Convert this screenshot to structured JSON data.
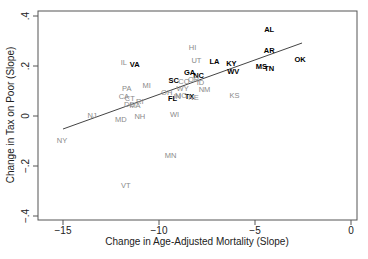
{
  "chart_data": {
    "type": "scatter",
    "title": "",
    "xlabel": "Change in Age-Adjusted Mortality (Slope)",
    "ylabel": "Change in Tax on Poor (Slope)",
    "xlim": [
      -16.3,
      0.3
    ],
    "ylim": [
      -0.42,
      0.42
    ],
    "xticks": [
      -15,
      -10,
      -5,
      0
    ],
    "xtick_labels": [
      "−15",
      "−10",
      "−5",
      "0"
    ],
    "yticks": [
      -0.4,
      -0.2,
      0,
      0.2,
      0.4
    ],
    "ytick_labels": [
      "−.4",
      "−.2",
      "0",
      ".2",
      ".4"
    ],
    "grid": false,
    "legend": null,
    "fit_line": {
      "x": [
        -15,
        -2.55
      ],
      "y": [
        -0.052,
        0.292
      ]
    },
    "colors": {
      "south": "#000000",
      "other": "#8a8a8a",
      "line": "#444444",
      "frame": "#555555"
    },
    "points": [
      {
        "label": "AL",
        "x": -4.26,
        "y": 0.348,
        "group": "south"
      },
      {
        "label": "AR",
        "x": -4.26,
        "y": 0.264,
        "group": "south"
      },
      {
        "label": "OK",
        "x": -2.65,
        "y": 0.228,
        "group": "south"
      },
      {
        "label": "MS",
        "x": -4.67,
        "y": 0.2,
        "group": "south"
      },
      {
        "label": "TN",
        "x": -4.26,
        "y": 0.192,
        "group": "south"
      },
      {
        "label": "KY",
        "x": -6.23,
        "y": 0.212,
        "group": "south"
      },
      {
        "label": "WV",
        "x": -6.13,
        "y": 0.18,
        "group": "south"
      },
      {
        "label": "LA",
        "x": -7.11,
        "y": 0.22,
        "group": "south"
      },
      {
        "label": "GA",
        "x": -8.41,
        "y": 0.176,
        "group": "south"
      },
      {
        "label": "NC",
        "x": -7.94,
        "y": 0.164,
        "group": "south"
      },
      {
        "label": "SC",
        "x": -9.24,
        "y": 0.144,
        "group": "south"
      },
      {
        "label": "TX",
        "x": -8.41,
        "y": 0.08,
        "group": "south"
      },
      {
        "label": "FL",
        "x": -9.29,
        "y": 0.072,
        "group": "south"
      },
      {
        "label": "VA",
        "x": -11.26,
        "y": 0.208,
        "group": "south"
      },
      {
        "label": "UT",
        "x": -8.05,
        "y": 0.224,
        "group": "other"
      },
      {
        "label": "HI",
        "x": -8.25,
        "y": 0.276,
        "group": "other"
      },
      {
        "label": "ID",
        "x": -7.84,
        "y": 0.136,
        "group": "other"
      },
      {
        "label": "NM",
        "x": -7.63,
        "y": 0.108,
        "group": "other"
      },
      {
        "label": "WY",
        "x": -8.77,
        "y": 0.112,
        "group": "other"
      },
      {
        "label": "CO",
        "x": -8.7,
        "y": 0.14,
        "group": "other"
      },
      {
        "label": "OR",
        "x": -8.2,
        "y": 0.15,
        "group": "other"
      },
      {
        "label": "OH",
        "x": -9.6,
        "y": 0.096,
        "group": "other"
      },
      {
        "label": "IN",
        "x": -9.05,
        "y": 0.08,
        "group": "other"
      },
      {
        "label": "MO",
        "x": -8.85,
        "y": 0.086,
        "group": "other"
      },
      {
        "label": "NE",
        "x": -8.2,
        "y": 0.078,
        "group": "other"
      },
      {
        "label": "KS",
        "x": -6.07,
        "y": 0.084,
        "group": "other"
      },
      {
        "label": "WI",
        "x": -9.19,
        "y": 0.008,
        "group": "other"
      },
      {
        "label": "MN",
        "x": -9.4,
        "y": -0.156,
        "group": "other"
      },
      {
        "label": "VT",
        "x": -11.73,
        "y": -0.276,
        "group": "other"
      },
      {
        "label": "NY",
        "x": -15.05,
        "y": -0.096,
        "group": "other"
      },
      {
        "label": "NJ",
        "x": -13.49,
        "y": 0.004,
        "group": "other"
      },
      {
        "label": "MD",
        "x": -11.99,
        "y": -0.012,
        "group": "other"
      },
      {
        "label": "NH",
        "x": -11.0,
        "y": 0.0,
        "group": "other"
      },
      {
        "label": "MI",
        "x": -10.64,
        "y": 0.124,
        "group": "other"
      },
      {
        "label": "PA",
        "x": -11.68,
        "y": 0.112,
        "group": "other"
      },
      {
        "label": "CA",
        "x": -11.83,
        "y": 0.08,
        "group": "other"
      },
      {
        "label": "CT",
        "x": -11.52,
        "y": 0.072,
        "group": "other"
      },
      {
        "label": "RI",
        "x": -11.0,
        "y": 0.06,
        "group": "other"
      },
      {
        "label": "DE",
        "x": -11.55,
        "y": 0.05,
        "group": "other"
      },
      {
        "label": "MA",
        "x": -11.25,
        "y": 0.044,
        "group": "other"
      },
      {
        "label": "IL",
        "x": -11.83,
        "y": 0.216,
        "group": "other"
      }
    ]
  }
}
